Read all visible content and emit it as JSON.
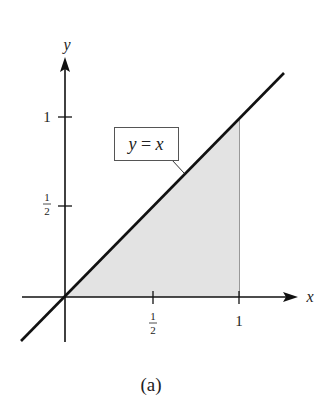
{
  "figure": {
    "caption": "(a)",
    "curve_label": "y = x",
    "curve_label_parts": {
      "lhs": "y",
      "eq": " = ",
      "rhs": "x"
    },
    "axes": {
      "x_label": "x",
      "y_label": "y",
      "x_ticks": [
        {
          "num": "1",
          "den": "2",
          "value": 0.5
        },
        {
          "text": "1",
          "value": 1
        }
      ],
      "y_ticks": [
        {
          "num": "1",
          "den": "2",
          "value": 0.5
        },
        {
          "text": "1",
          "value": 1
        }
      ]
    },
    "shaded_region": "area under y = x from x = 0 to x = 1",
    "colors": {
      "line": "#111111",
      "shade": "#e3e3e3",
      "background": "#ffffff"
    }
  }
}
